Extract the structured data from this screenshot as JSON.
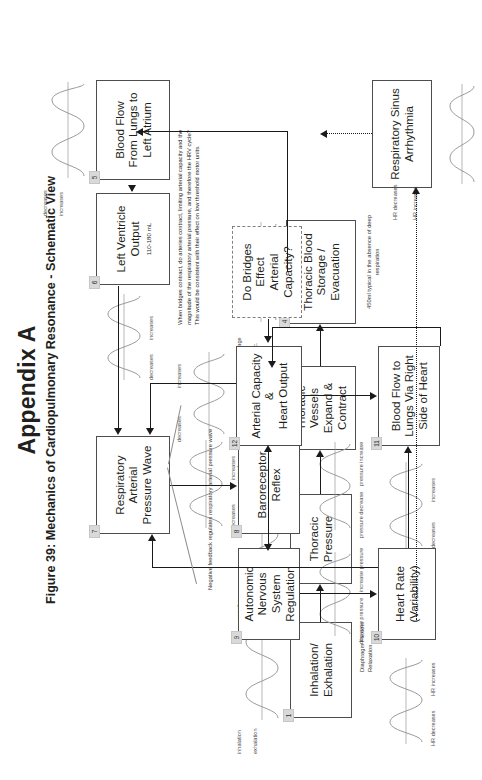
{
  "header": {
    "appendix": "Appendix A",
    "figure_caption": "Figure 39: Mechanics of Cardiopulmonary Resonance - Schematic View"
  },
  "nodes": [
    {
      "num": "1",
      "label": "Inhalation/\nExhalation",
      "sub": "",
      "wave_low": "exhalation",
      "wave_high": "inhalation"
    },
    {
      "num": "2",
      "label": "Thoracic\nPressure",
      "sub": "",
      "wave_low": "positive",
      "wave_high": "negative"
    },
    {
      "num": "3",
      "label": "Thoracic\nVessels\nExpand &\nContract",
      "sub": "",
      "wave_low": "contract",
      "wave_high": "expand"
    },
    {
      "num": "4",
      "label": "Thoracic Blood\nStorage /\nEvacuation",
      "sub": "450ml typical in the absence of deep respiration",
      "wave_low": "evac.",
      "wave_high": "storage"
    },
    {
      "num": "5",
      "label": "Blood Flow\nFrom Lungs to\nLeft Atrium",
      "sub": "",
      "wave_low": "increases",
      "wave_high": "decreases"
    },
    {
      "num": "6",
      "label": "Left Ventricle\nOutput",
      "sub": "110-180 mL",
      "wave_low": "increases",
      "wave_high": "decreases"
    },
    {
      "num": "7",
      "label": "Respiratory\nArterial\nPressure Wave",
      "sub": "",
      "wave_low": "increases",
      "wave_high": "decreases"
    },
    {
      "num": "8",
      "label": "Baroreceptor\nReflex",
      "sub": "",
      "wave_low": "pressure increase",
      "wave_high": "pressure decrease"
    },
    {
      "num": "9",
      "label": "Autonomic\nNervous System\nRegulation",
      "sub": "",
      "wave_low": "increase pressure",
      "wave_high": "decrease pressure"
    },
    {
      "num": "10",
      "label": "Heart Rate\n(Variability)",
      "sub": "",
      "wave_low": "HR increases",
      "wave_high": "HR decreases"
    },
    {
      "num": "11",
      "label": "Blood Flow to\nLungs Via Right\nSide of Heart",
      "sub": "",
      "wave_low": "increases",
      "wave_high": "decreases"
    },
    {
      "num": "12",
      "label": "Arterial Capacity\n&\nHeart Output",
      "sub": "",
      "wave_low": "increases",
      "wave_high": "decreases"
    }
  ],
  "rsa": {
    "label": "Respiratory Sinus\nArrhythmia",
    "wave_low": "HR increases",
    "wave_high": "HR decreases"
  },
  "question_box": {
    "label": "Do Bridges\nEffect\nArterial\nCapacity?"
  },
  "annotations": {
    "diaphragm": "Diaphragm Flexion/\nRelaxation",
    "negative_feedback": "Negative feedback regulates respiratory arterial pressure wave",
    "bridges_note": "When bridges contract, do arteries contract, limiting arterial capacity and the magnitude of the respiratory arterial pressure, and therefore the HRV cycle? This would be consistent with their effect on low threshold motor units."
  },
  "colors": {
    "ink": "#231f20",
    "box_border": "#4d4d4d",
    "line": "#1a1a1a",
    "badge_bg": "#d9d9d9",
    "wave": "#9a9a9a"
  }
}
